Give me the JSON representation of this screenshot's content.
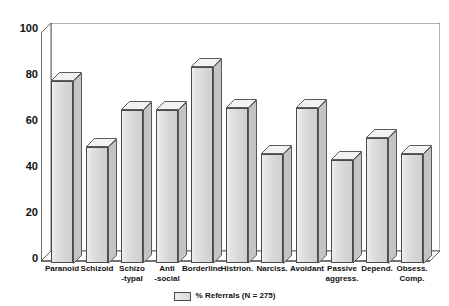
{
  "chart_data": {
    "type": "bar",
    "title": "",
    "xlabel": "",
    "ylabel": "",
    "ylim": [
      0,
      100
    ],
    "yticks": [
      "0",
      "20",
      "40",
      "60",
      "80",
      "100"
    ],
    "grid": false,
    "legend_position": "bottom",
    "legend": [
      "% Referrals (N = 275)"
    ],
    "series_name": "% Referrals (N = 275)",
    "categories": [
      "Paranoid",
      "Schizoid",
      "Schizo\n-typal",
      "Anti\n-social",
      "Borderline",
      "Histrion.",
      "Narciss.",
      "Avoidant",
      "Passive\naggress.",
      "Depend.",
      "Obsess.\nComp."
    ],
    "values": [
      80,
      51,
      67,
      67,
      86,
      68,
      48,
      68,
      45,
      55,
      48
    ]
  }
}
